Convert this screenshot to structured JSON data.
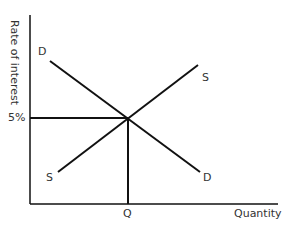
{
  "diagram": {
    "y_axis_label": "Rate of interest",
    "x_axis_label": "Quantity",
    "equilibrium_rate_label": "5%",
    "equilibrium_quantity_label": "Q",
    "demand_label_top": "D",
    "demand_label_bottom": "D",
    "supply_label_top": "S",
    "supply_label_bottom": "S",
    "line_color": "#111111"
  }
}
